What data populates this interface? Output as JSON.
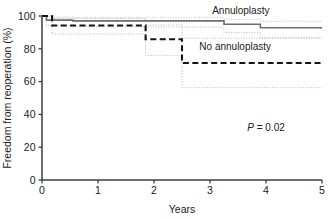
{
  "chart_data": {
    "type": "line",
    "title": "",
    "subtitle": "",
    "xlabel": "Years",
    "ylabel": "Freedom from reoperation (%)",
    "xlim": [
      0,
      5
    ],
    "ylim": [
      0,
      100
    ],
    "xticks": [
      "0",
      "1",
      "2",
      "3",
      "4",
      "5"
    ],
    "yticks": [
      "0",
      "20",
      "40",
      "60",
      "80",
      "100"
    ],
    "grid": false,
    "legend_position": "inside-right-annotated",
    "annotations": [
      {
        "name": "p-value",
        "prefix": "P",
        "equals": " = ",
        "value": "0.02",
        "x": 4.0,
        "y": 30
      }
    ],
    "series": [
      {
        "name": "Annuloplasty",
        "style": "solid",
        "color": "#6e6e6e",
        "label_x": 3.55,
        "label_y": 99.5,
        "steps": [
          {
            "x": 0.0,
            "y": 100.0
          },
          {
            "x": 0.08,
            "y": 97.5
          },
          {
            "x": 0.55,
            "y": 97.0
          },
          {
            "x": 3.25,
            "y": 95.0
          },
          {
            "x": 3.9,
            "y": 92.8
          },
          {
            "x": 5.0,
            "y": 92.8
          }
        ],
        "ci_upper": [
          {
            "x": 0.0,
            "y": 100.0
          },
          {
            "x": 0.08,
            "y": 99.3
          },
          {
            "x": 0.55,
            "y": 99.0
          },
          {
            "x": 3.25,
            "y": 98.0
          },
          {
            "x": 3.9,
            "y": 96.8
          },
          {
            "x": 5.0,
            "y": 96.8
          }
        ],
        "ci_lower": [
          {
            "x": 0.0,
            "y": 100.0
          },
          {
            "x": 0.08,
            "y": 94.0
          },
          {
            "x": 0.55,
            "y": 93.5
          },
          {
            "x": 1.85,
            "y": 93.3
          },
          {
            "x": 3.25,
            "y": 90.0
          },
          {
            "x": 3.9,
            "y": 86.8
          },
          {
            "x": 5.0,
            "y": 86.8
          }
        ]
      },
      {
        "name": "No annuloplasty",
        "style": "dashed",
        "color": "#141414",
        "label_x": 3.45,
        "label_y": 77.5,
        "steps": [
          {
            "x": 0.0,
            "y": 100.0
          },
          {
            "x": 0.18,
            "y": 94.2
          },
          {
            "x": 1.85,
            "y": 94.0
          },
          {
            "x": 1.85,
            "y": 85.8
          },
          {
            "x": 2.5,
            "y": 85.8
          },
          {
            "x": 2.5,
            "y": 71.3
          },
          {
            "x": 5.0,
            "y": 71.3
          }
        ],
        "ci_upper": [
          {
            "x": 0.0,
            "y": 100.0
          },
          {
            "x": 0.18,
            "y": 98.5
          },
          {
            "x": 1.85,
            "y": 98.3
          },
          {
            "x": 1.85,
            "y": 94.5
          },
          {
            "x": 2.5,
            "y": 94.5
          },
          {
            "x": 2.5,
            "y": 86.5
          },
          {
            "x": 5.0,
            "y": 86.5
          }
        ],
        "ci_lower": [
          {
            "x": 0.0,
            "y": 100.0
          },
          {
            "x": 0.18,
            "y": 89.0
          },
          {
            "x": 1.85,
            "y": 88.8
          },
          {
            "x": 1.85,
            "y": 76.0
          },
          {
            "x": 2.5,
            "y": 76.0
          },
          {
            "x": 2.5,
            "y": 56.3
          },
          {
            "x": 5.0,
            "y": 56.3
          }
        ]
      }
    ],
    "ci_style": "dotted",
    "ci_color": "#b8b8b8",
    "axis_color": "#3c3c3c"
  },
  "geometry": {
    "plot_left": 42,
    "plot_right": 322,
    "plot_top": 16,
    "plot_bottom": 180
  }
}
